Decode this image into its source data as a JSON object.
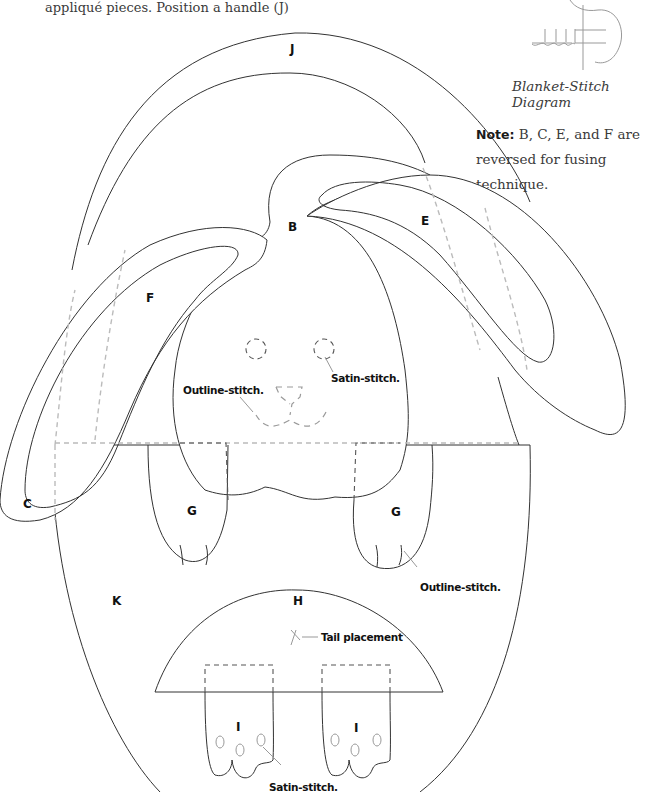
{
  "intro_text": "appliqué pieces. Position a handle (J)",
  "stitch_diagram": {
    "caption": "Blanket-Stitch Diagram",
    "icon": "blanket-stitch-icon"
  },
  "note": {
    "label": "Note:",
    "text": " B, C, E, and F are reversed for fusing technique."
  },
  "pieces": {
    "J": "J",
    "B": "B",
    "E": "E",
    "F": "F",
    "C": "C",
    "G_left": "G",
    "G_right": "G",
    "K": "K",
    "H": "H",
    "I_left": "I",
    "I_right": "I"
  },
  "annotations": {
    "eye_satin": "Satin-stitch.",
    "nose_outline": "Outline-stitch.",
    "paw_outline": "Outline-stitch.",
    "tail": "Tail placement",
    "foot_satin": "Satin-stitch."
  },
  "colors": {
    "line": "#333333",
    "dashed_light": "#bbbbbb",
    "text": "#111111"
  }
}
